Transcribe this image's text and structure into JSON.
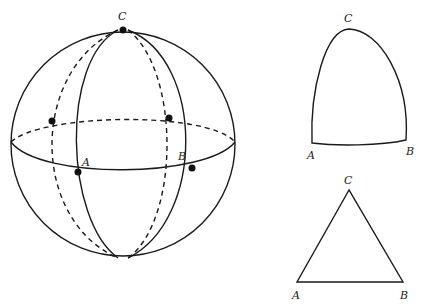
{
  "figure": {
    "sphere": {
      "labels": {
        "top": "C",
        "left_front": "A",
        "right_front": "B"
      },
      "points": [
        "C",
        "A",
        "B",
        "back-left-vertex",
        "back-right-vertex"
      ],
      "description": "Sphere with equator and meridians through pole C; front lines solid, hidden lines dashed"
    },
    "spherical_triangle": {
      "labels": {
        "top": "C",
        "bottom_left": "A",
        "bottom_right": "B"
      },
      "description": "Spherical triangle ABC with curved sides"
    },
    "plane_triangle": {
      "labels": {
        "top": "C",
        "bottom_left": "A",
        "bottom_right": "B"
      },
      "description": "Flat (Euclidean) triangle ABC"
    }
  },
  "colors": {
    "stroke": "#1a1a1a",
    "background": "#ffffff"
  }
}
